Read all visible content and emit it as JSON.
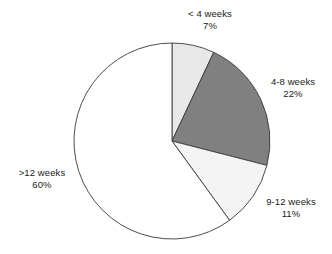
{
  "chart_data": {
    "type": "pie",
    "title": "",
    "subtitle": "",
    "xlabel": "",
    "ylabel": "",
    "grid": false,
    "legend_position": "none",
    "label_format": "name + percent",
    "start_angle_deg": 0,
    "direction": "clockwise",
    "categories": [
      "< 4 weeks",
      "4-8 weeks",
      "9-12 weeks",
      ">12 weeks"
    ],
    "values": [
      7,
      22,
      11,
      60
    ],
    "value_labels": [
      "7%",
      "22%",
      "11%",
      "60%"
    ],
    "colors": [
      "#e8e8e8",
      "#808080",
      "#f4f4f4",
      "#ffffff"
    ],
    "outline_color": "#3a3a3a",
    "total": 100,
    "units": "percent",
    "slices": [
      {
        "name": "< 4 weeks",
        "value": 7,
        "value_label": "7%",
        "color": "#e8e8e8",
        "start_deg": 0,
        "end_deg": 25.2
      },
      {
        "name": "4-8 weeks",
        "value": 22,
        "value_label": "22%",
        "color": "#808080",
        "start_deg": 25.2,
        "end_deg": 104.4
      },
      {
        "name": "9-12 weeks",
        "value": 11,
        "value_label": "11%",
        "color": "#f4f4f4",
        "start_deg": 104.4,
        "end_deg": 144.0
      },
      {
        "name": ">12 weeks",
        "value": 60,
        "value_label": "60%",
        "color": "#ffffff",
        "start_deg": 144.0,
        "end_deg": 360.0
      }
    ]
  },
  "labels": {
    "lt4": {
      "name": "< 4 weeks",
      "percent": "7%"
    },
    "w48": {
      "name": "4-8 weeks",
      "percent": "22%"
    },
    "w912": {
      "name": "9-12 weeks",
      "percent": "11%"
    },
    "gt12": {
      "name": ">12 weeks",
      "percent": "60%"
    }
  },
  "geometry": {
    "center_x": 172,
    "center_y": 141,
    "radius": 98
  }
}
